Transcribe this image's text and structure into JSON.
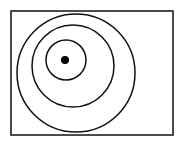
{
  "diagram": {
    "frame": {
      "x": 11,
      "y": 11,
      "width": 162,
      "height": 124
    },
    "circles": [
      {
        "name": "outer",
        "cx": 76,
        "cy": 73,
        "r": 59
      },
      {
        "name": "middle",
        "cx": 73,
        "cy": 66,
        "r": 41
      },
      {
        "name": "inner",
        "cx": 66,
        "cy": 60,
        "r": 20
      }
    ],
    "dot": {
      "cx": 65,
      "cy": 60,
      "r": 4
    },
    "stroke_color": "#111111",
    "background": "#ffffff"
  }
}
